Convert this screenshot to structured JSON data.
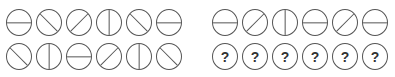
{
  "puzzle": {
    "left_group": {
      "row1": [
        "horizontal",
        "backslash",
        "slash",
        "vertical",
        "backslash",
        "horizontal"
      ],
      "row2": [
        "backslash",
        "vertical",
        "horizontal",
        "slash",
        "vertical",
        "backslash"
      ]
    },
    "right_group": {
      "row1": [
        "horizontal",
        "slash",
        "vertical",
        "horizontal",
        "slash",
        "horizontal"
      ],
      "row2": [
        "?",
        "?",
        "?",
        "?",
        "?",
        "?"
      ]
    },
    "unknown_symbol": "?",
    "line_color": "#555555"
  }
}
